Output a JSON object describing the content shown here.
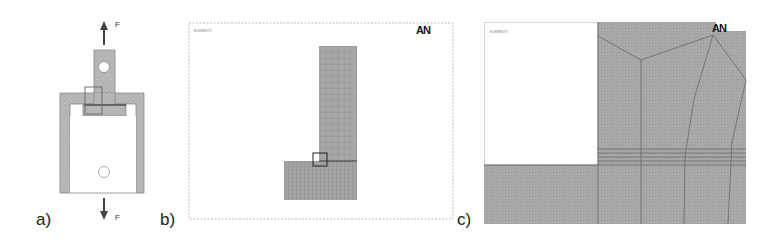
{
  "figure": {
    "panels": [
      {
        "id": "a",
        "label": "a)",
        "description": "Schematic of loaded specimen with housing",
        "force_top_label": "F",
        "force_bottom_label": "F"
      },
      {
        "id": "b",
        "label": "b)",
        "description": "FE mesh of half model",
        "window_caption": "ELEMENTS",
        "logo": "AN"
      },
      {
        "id": "c",
        "label": "c)",
        "description": "Zoomed mesh detail near corner",
        "window_caption": "ELEMENTS",
        "logo": "AN"
      }
    ],
    "colors": {
      "material_fill": "#a9a9a9",
      "mesh_line": "#7a7a7a",
      "outline": "#555555",
      "background": "#ffffff"
    }
  }
}
